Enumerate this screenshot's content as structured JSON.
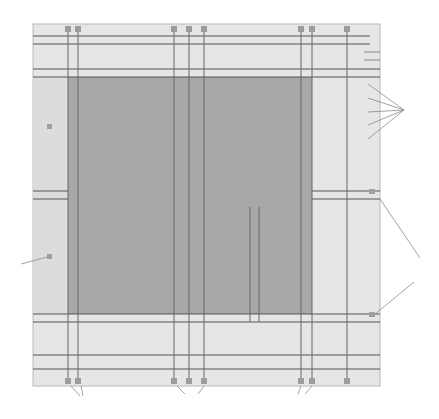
{
  "diagram": {
    "colors": {
      "panel_fill": "#e6e6e6",
      "panel_border": "#b9b9b9",
      "dark_region": "#a8a8a8",
      "line_dark": "#555555",
      "line_mid": "#7a7a7a",
      "square": "#9c9c9c",
      "leader": "#8a8a8a"
    },
    "column_labels": {
      "A": "A",
      "B": "B",
      "C": "C",
      "D": "D",
      "E": "E",
      "F": "F",
      "G": "G",
      "H": "H"
    },
    "row_labels": {
      "K": "K",
      "L": "L",
      "M": "M",
      "H": "H"
    },
    "inner_labels": {
      "S": "S",
      "T": "T",
      "V": "V",
      "U": "U",
      "P": "P",
      "Q": "Q"
    },
    "r_labels_top": [
      "R",
      "R",
      "R"
    ],
    "r_labels_bottom": [
      "R",
      "R",
      "R"
    ],
    "r_prime_labels": [
      "R'",
      "R'",
      "R'",
      "R'",
      "R'",
      "R'"
    ],
    "callouts": {
      "Y": "Y",
      "X_right": "X",
      "Z": "Z",
      "X_bottom_1": "X",
      "X_bottom_2": "X",
      "X_bottom_3": "X"
    }
  }
}
